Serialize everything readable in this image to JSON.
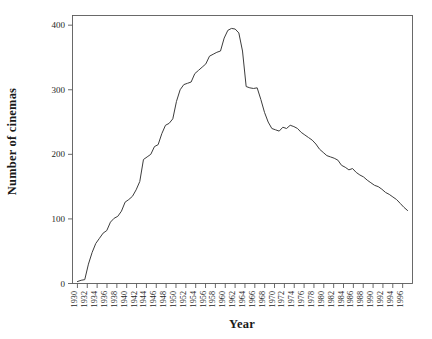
{
  "chart_data": {
    "type": "line",
    "title": "",
    "xlabel": "Year",
    "ylabel": "Number of cinemas",
    "xlim": [
      1929,
      1998
    ],
    "ylim": [
      0,
      415
    ],
    "grid": false,
    "legend": "none",
    "line_color": "#3c3c3c",
    "axis_color": "#5a5a5a",
    "background": "#ffffff",
    "x_tick_labels": [
      "1930",
      "1932",
      "1934",
      "1936",
      "1938",
      "1940",
      "1942",
      "1944",
      "1946",
      "1948",
      "1950",
      "1952",
      "1954",
      "1956",
      "1958",
      "1960",
      "1962",
      "1964",
      "1966",
      "1968",
      "1970",
      "1972",
      "1974",
      "1976",
      "1978",
      "1980",
      "1982",
      "1984",
      "1986",
      "1988",
      "1990",
      "1992",
      "1994",
      "1996"
    ],
    "x_tick_values": [
      1930,
      1932,
      1934,
      1936,
      1938,
      1940,
      1942,
      1944,
      1946,
      1948,
      1950,
      1952,
      1954,
      1956,
      1958,
      1960,
      1962,
      1964,
      1966,
      1968,
      1970,
      1972,
      1974,
      1976,
      1978,
      1980,
      1982,
      1984,
      1986,
      1988,
      1990,
      1992,
      1994,
      1996
    ],
    "y_tick_labels": [
      "0",
      "100",
      "200",
      "300",
      "400"
    ],
    "y_tick_values": [
      0,
      100,
      200,
      300,
      400
    ],
    "x": [
      1930,
      1931,
      1932,
      1933,
      1934,
      1935,
      1936,
      1937,
      1938,
      1939,
      1940,
      1941,
      1942,
      1943,
      1944,
      1945,
      1946,
      1947,
      1948,
      1949,
      1950,
      1951,
      1952,
      1953,
      1954,
      1955,
      1956,
      1957,
      1958,
      1959,
      1960,
      1961,
      1962,
      1963,
      1964,
      1965,
      1966,
      1967,
      1968,
      1969,
      1970,
      1971,
      1972,
      1973,
      1974,
      1975,
      1976,
      1977,
      1978,
      1979,
      1980,
      1981,
      1982,
      1983,
      1984,
      1985,
      1986,
      1987,
      1988,
      1989,
      1990,
      1991,
      1992,
      1993,
      1994,
      1995,
      1996,
      1997
    ],
    "y": [
      3,
      5,
      6,
      30,
      48,
      62,
      70,
      78,
      82,
      95,
      101,
      104,
      112,
      126,
      130,
      135,
      145,
      158,
      192,
      196,
      200,
      212,
      215,
      232,
      245,
      248,
      255,
      282,
      300,
      308,
      310,
      312,
      325,
      330,
      335,
      340,
      352,
      355,
      358,
      360,
      380,
      392,
      395,
      394,
      388,
      360,
      305,
      303,
      302,
      303,
      285,
      265,
      250,
      240,
      238,
      236,
      242,
      240,
      245,
      243,
      240,
      234,
      230,
      226,
      222,
      216,
      208,
      203,
      198,
      196,
      194,
      191,
      183,
      180,
      176,
      178,
      172,
      168,
      165,
      160,
      156,
      152,
      150,
      146,
      141,
      138,
      134,
      130,
      124,
      118,
      113
    ],
    "series_name": "Number of cinemas"
  },
  "figure": {
    "ylabel_text": "Number of cinemas",
    "xlabel_text": "Year"
  }
}
